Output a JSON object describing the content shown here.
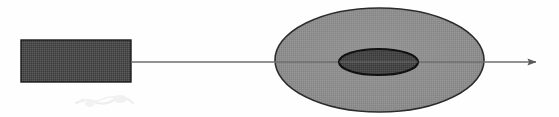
{
  "figure": {
    "domain": "Diagram",
    "canvas": {
      "width": 559,
      "height": 117
    },
    "background_color": "#fefefe"
  },
  "shapes": {
    "source_block": {
      "name": "source-block",
      "type": "rectangle",
      "x": 21,
      "y": 40,
      "width": 110,
      "height": 42,
      "fill_color": "#4f4f4f",
      "stroke_color": "#1a1a1a",
      "stroke_width": 1.4,
      "texture": "dither"
    },
    "outer_ellipse": {
      "name": "outer-ellipse",
      "type": "ellipse",
      "cx": 379.5,
      "cy": 60,
      "rx": 104.5,
      "ry": 52,
      "fill_color": "#8f8f8f",
      "stroke_color": "#2b2b2b",
      "stroke_width": 1.6,
      "texture": "dither"
    },
    "inner_ellipse": {
      "name": "inner-ellipse",
      "type": "ellipse",
      "cx": 378.5,
      "cy": 62,
      "rx": 39.5,
      "ry": 13,
      "fill_color": "#494949",
      "stroke_color": "#111111",
      "stroke_width": 2.2,
      "texture": "dither"
    },
    "axis_arrow": {
      "name": "axis-arrow",
      "type": "arrow",
      "x1": 131,
      "y1": 62,
      "x2": 545,
      "y2": 62,
      "stroke_color": "#6e6e6e",
      "stroke_width": 1.6,
      "arrowhead": {
        "name": "arrowhead",
        "tip_x": 545,
        "back_x": 530,
        "half_height": 5,
        "fill_color": "#5a5a5a"
      }
    },
    "scan_smudge": {
      "name": "scan-smudge",
      "type": "artifact",
      "x": 74,
      "y": 94,
      "width": 62,
      "height": 14,
      "color": "#ededed"
    }
  }
}
